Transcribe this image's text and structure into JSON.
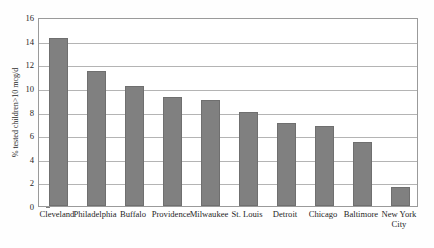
{
  "chart_data": {
    "type": "bar",
    "title": "",
    "subtitle": "",
    "xlabel": "",
    "ylabel": "% tested children>10 mcg/d",
    "categories": [
      "Cleveland",
      "Philadelphia",
      "Buffalo",
      "Providence",
      "Milwaukee",
      "St. Louis",
      "Detroit",
      "Chicago",
      "Baltimore",
      "New York\nCity"
    ],
    "values": [
      14.2,
      11.4,
      10.2,
      9.2,
      9.0,
      8.0,
      7.0,
      6.8,
      5.45,
      1.65
    ],
    "ylim": [
      0,
      16
    ],
    "ytick_values": [
      0,
      2,
      4,
      6,
      8,
      10,
      12,
      14,
      16
    ],
    "ytick_labels": [
      "0",
      "2",
      "4",
      "6",
      "8",
      "10",
      "12",
      "14",
      "16"
    ],
    "grid": "horizontal",
    "legend": "none",
    "bar_color": "#808080",
    "gridline_color": "#b4b4b4",
    "axis_color": "#9a9a9a",
    "background_color": "#ffffff"
  }
}
